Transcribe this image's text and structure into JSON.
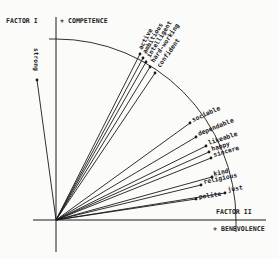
{
  "diagram": {
    "type": "factor-loading-vector-plot",
    "colors": {
      "ink": "#1a1a1a",
      "paper": "#fbfbfa"
    },
    "axes": {
      "vertical": {
        "factor_label": "FACTOR I",
        "pole_label": "+ COMPETENCE"
      },
      "horizontal": {
        "factor_label": "FACTOR II",
        "pole_label": "+ BENEVOLENCE"
      }
    },
    "vectors": [
      {
        "label": "strong",
        "tip": [
          37,
          80
        ],
        "text_at": [
          34,
          48
        ],
        "angle": 90,
        "anchor": "start"
      },
      {
        "label": "active",
        "tip": [
          140,
          54
        ],
        "text_at": [
          142,
          50
        ],
        "angle": -62
      },
      {
        "label": "ambitious",
        "tip": [
          143,
          58
        ],
        "text_at": [
          146,
          54
        ],
        "angle": -60
      },
      {
        "label": "intelligent",
        "tip": [
          146,
          62
        ],
        "text_at": [
          150,
          58
        ],
        "angle": -58
      },
      {
        "label": "hard-working",
        "tip": [
          150,
          67
        ],
        "text_at": [
          154,
          63
        ],
        "angle": -56
      },
      {
        "label": "confident",
        "tip": [
          155,
          73
        ],
        "text_at": [
          160,
          68
        ],
        "angle": -54
      },
      {
        "label": "sociable",
        "tip": [
          190,
          123
        ],
        "text_at": [
          193,
          122
        ],
        "angle": -24
      },
      {
        "label": "dependable",
        "tip": [
          196,
          137
        ],
        "text_at": [
          199,
          136
        ],
        "angle": -22
      },
      {
        "label": "likeable",
        "tip": [
          206,
          146
        ],
        "text_at": [
          209,
          145
        ],
        "angle": -18
      },
      {
        "label": "happy",
        "tip": [
          209,
          152
        ],
        "text_at": [
          212,
          151
        ],
        "angle": -17
      },
      {
        "label": "sincere",
        "tip": [
          211,
          158
        ],
        "text_at": [
          214,
          157
        ],
        "angle": -16
      },
      {
        "label": "kind",
        "tip": [
          212,
          177
        ],
        "text_at": [
          214,
          176
        ],
        "angle": -13
      },
      {
        "label": "religious",
        "tip": [
          201,
          185
        ],
        "text_at": [
          204,
          184
        ],
        "angle": -12
      },
      {
        "label": "just",
        "tip": [
          225,
          193
        ],
        "text_at": [
          228,
          192
        ],
        "angle": -10
      },
      {
        "label": "polite",
        "tip": [
          196,
          199
        ],
        "text_at": [
          199,
          199
        ],
        "angle": -8
      }
    ]
  }
}
